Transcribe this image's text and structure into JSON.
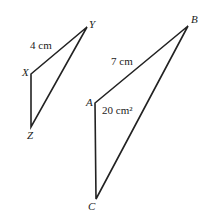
{
  "figure": {
    "triangle_small": {
      "vertices": {
        "X": "X",
        "Y": "Y",
        "Z": "Z"
      },
      "side_label": "4 cm"
    },
    "triangle_large": {
      "vertices": {
        "A": "A",
        "B": "B",
        "C": "C"
      },
      "side_label": "7 cm",
      "area_label": "20 cm²"
    },
    "line_color": "#222222"
  }
}
